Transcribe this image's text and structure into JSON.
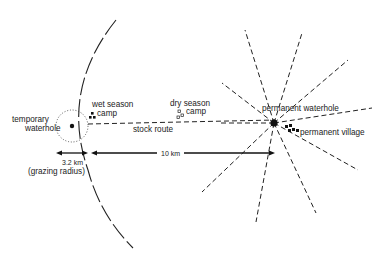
{
  "diagram": {
    "labels": {
      "temporary_waterhole_line1": "temporary",
      "temporary_waterhole_line2": "waterhole",
      "wet_season_camp_line1": "wet season",
      "wet_season_camp_line2": "camp",
      "dry_season_camp_line1": "dry season",
      "dry_season_camp_line2": "camp",
      "stock_route": "stock   route",
      "permanent_waterhole": "permanent waterhole",
      "permanent_village": "permanent village",
      "distance_grazing": "3.2 km",
      "grazing_radius": "(grazing radius)",
      "distance_main": "10 km"
    },
    "colors": {
      "ink": "#222222",
      "background": "#ffffff"
    }
  }
}
